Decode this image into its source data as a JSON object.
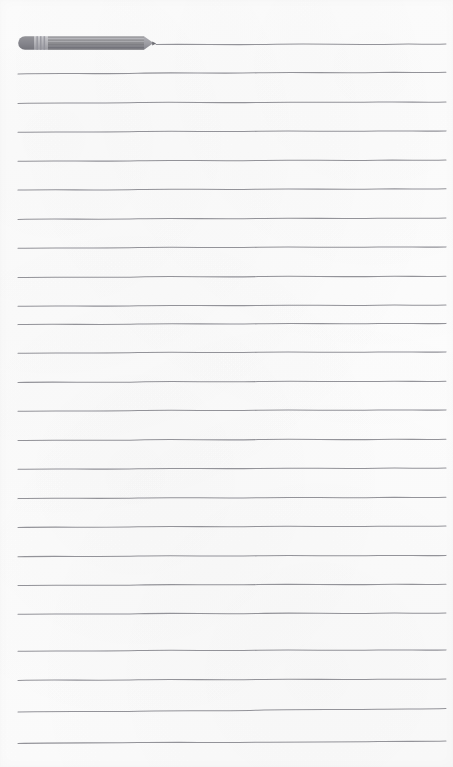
{
  "page": {
    "width": 453,
    "height": 767,
    "background_color": "#fdfdfd",
    "paper_tint": "#fbfbfb"
  },
  "ruling": {
    "label": "Ruled lines",
    "line_color": "#8a8a90",
    "line_thickness_px": 1,
    "line_count": 25,
    "line_spacing_px": 29,
    "left_margin_px": 18,
    "right_margin_px": 446,
    "first_line_y_px": 44,
    "style": "hand-drawn wavy horizontal rules",
    "note": "The topmost rule begins at the pencil tip rather than the left margin.",
    "line_y_positions": [
      44,
      73,
      102,
      131,
      160,
      189,
      218,
      247,
      276,
      305,
      323,
      352,
      381,
      410,
      439,
      468,
      497,
      526,
      555,
      584,
      613,
      650,
      679,
      711,
      742
    ],
    "line_start_x": [
      156,
      18,
      18,
      18,
      18,
      18,
      18,
      18,
      18,
      18,
      18,
      18,
      18,
      18,
      18,
      18,
      18,
      18,
      18,
      18,
      18,
      18,
      18,
      18,
      18
    ]
  },
  "pencil": {
    "label": "Pencil",
    "icon": "pencil-icon",
    "body_color": "#8f8f92",
    "body_color_dark": "#7b7b7f",
    "body_color_light": "#a6a6aa",
    "ferrule_color": "#b8b8bc",
    "eraser_color": "#82828a",
    "tip_color": "#9a9a9e",
    "lead_color": "#6c6c72",
    "x_px": 18,
    "y_px": 36,
    "length_px": 138,
    "thickness_px": 14,
    "orientation": "horizontal",
    "tip_direction": "right",
    "tip_x_px": 156,
    "barrel_stripes": 4,
    "ferrule_bands": 3
  }
}
